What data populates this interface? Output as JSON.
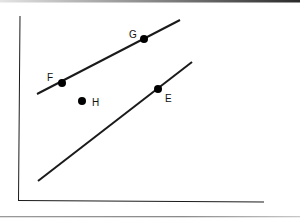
{
  "diagram": {
    "type": "coordinate-geometry",
    "points": [
      {
        "label": "F",
        "x": 62,
        "y": 83,
        "label_x": 47,
        "label_y": 81
      },
      {
        "label": "G",
        "x": 144,
        "y": 39,
        "label_x": 129,
        "label_y": 38
      },
      {
        "label": "E",
        "x": 158,
        "y": 89,
        "label_x": 165,
        "label_y": 102
      },
      {
        "label": "H",
        "x": 82,
        "y": 101,
        "label_x": 92,
        "label_y": 106
      }
    ],
    "lines": [
      {
        "name": "line-FG",
        "x1": 37,
        "y1": 94,
        "x2": 180,
        "y2": 20
      },
      {
        "name": "line-E",
        "x1": 38,
        "y1": 181,
        "x2": 192,
        "y2": 62
      }
    ],
    "colors": {
      "stroke": "#1a1a1a",
      "background": "#ffffff"
    }
  }
}
